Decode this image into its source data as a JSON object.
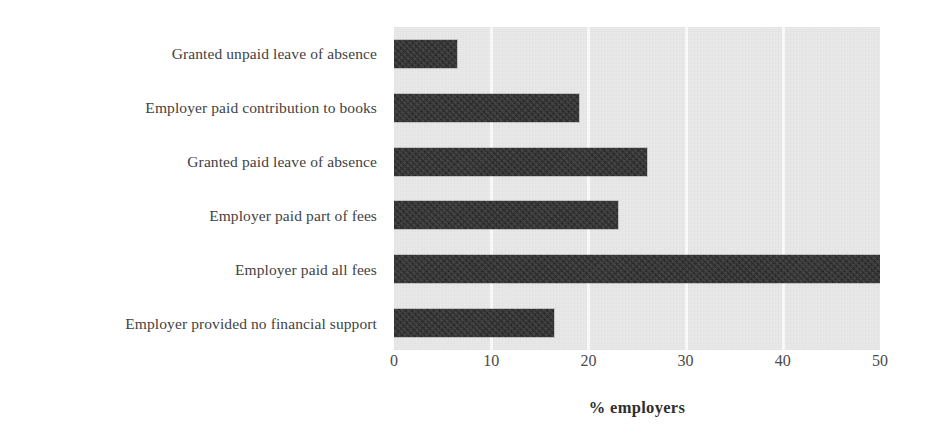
{
  "chart_data": {
    "type": "bar",
    "orientation": "horizontal",
    "title": "",
    "subtitle": "",
    "xlabel": "% employers",
    "ylabel": "",
    "xlim": [
      0,
      50
    ],
    "ylim": null,
    "grid": true,
    "grid_axis": "x",
    "legend": false,
    "legend_position": "none",
    "xticks": [
      0,
      10,
      20,
      30,
      40,
      50
    ],
    "xtick_labels": [
      "0",
      "10",
      "20",
      "30",
      "40",
      "50"
    ],
    "categories": [
      "Granted unpaid leave of absence",
      "Employer paid contribution to books",
      "Granted paid leave of absence",
      "Employer paid part of fees",
      "Employer paid all fees",
      "Employer provided no financial support"
    ],
    "values": [
      6.5,
      19,
      26,
      23,
      50,
      16.5
    ],
    "bars": [
      {
        "category": "Granted unpaid leave of absence",
        "value": 6.5
      },
      {
        "category": "Employer paid contribution to books",
        "value": 19
      },
      {
        "category": "Granted paid leave of absence",
        "value": 26
      },
      {
        "category": "Employer paid part of fees",
        "value": 23
      },
      {
        "category": "Employer paid all fees",
        "value": 50
      },
      {
        "category": "Employer provided no financial support",
        "value": 16.5
      }
    ]
  },
  "colors": {
    "bar": "#2c2c2c",
    "plot_background": "#e9e9e9",
    "gridline": "#fbfbfb",
    "page_background": "#ffffff",
    "label_text": "#424242",
    "tick_text": "#4a4a4a",
    "axis_title_text": "#2f2f2f"
  }
}
